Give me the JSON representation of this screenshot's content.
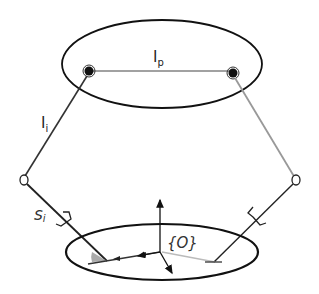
{
  "diagram": {
    "type": "parallel-robot-kinematic-sketch",
    "labels": {
      "platform_length": "l",
      "platform_length_sub": "p",
      "leg_length": "l",
      "leg_length_sub": "i",
      "slider": "s",
      "slider_sub": "i",
      "origin_frame": "{O}"
    },
    "colors": {
      "outline": "#111111",
      "left_leg": "#333333",
      "right_leg": "#999999",
      "base_vector_light": "#bbbbbb",
      "angle_fill": "#aaaaaa"
    }
  }
}
